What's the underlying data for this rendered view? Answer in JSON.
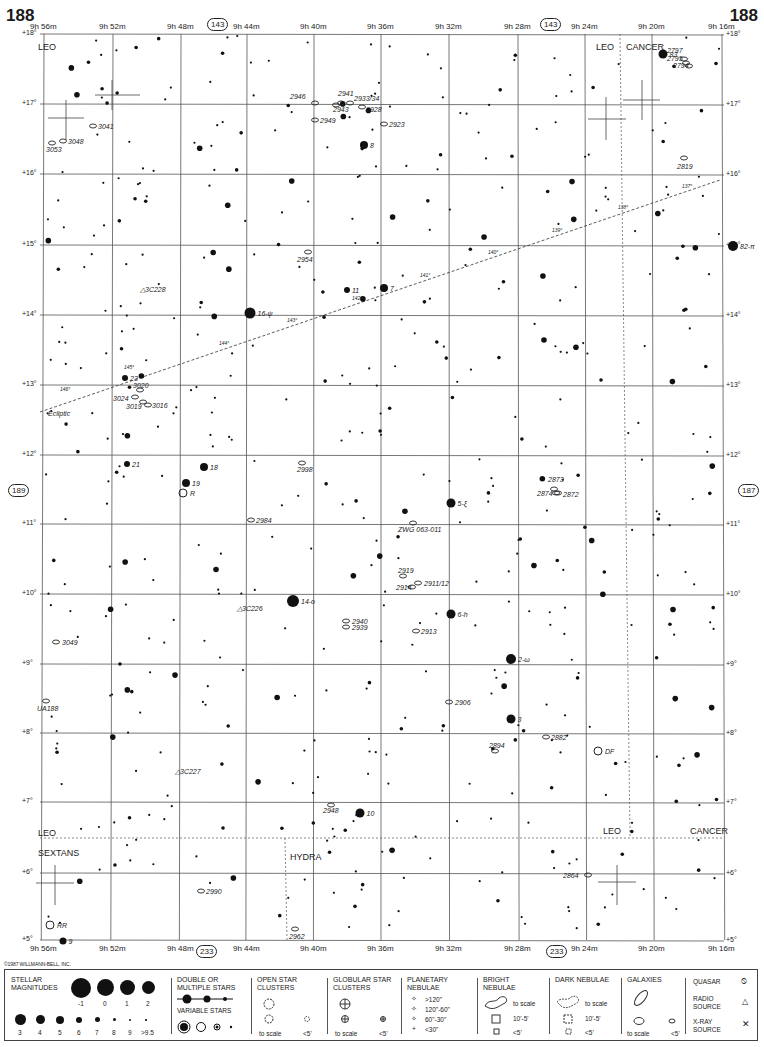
{
  "page": {
    "number_left": "188",
    "number_right": "188",
    "adjacent_left": "189",
    "adjacent_right": "187",
    "adjacent_top": "143",
    "adjacent_bottom": "233",
    "copyright": "©1987 WILLMANN-BELL, INC."
  },
  "axes": {
    "ra_top": [
      "9h 56m",
      "9h 52m",
      "9h 48m",
      "9h 44m",
      "9h 40m",
      "9h 36m",
      "9h 32m",
      "9h 28m",
      "9h 24m",
      "9h 20m",
      "9h 16m"
    ],
    "ra_bottom": [
      "9h 56m",
      "9h 52m",
      "9h 48m",
      "9h 44m",
      "9h 40m",
      "9h 36m",
      "9h 32m",
      "9h 28m",
      "9h 24m",
      "9h 20m",
      "9h 16m"
    ],
    "dec": [
      "+18°",
      "+17°",
      "+16°",
      "+15°",
      "+14°",
      "+13°",
      "+12°",
      "+11°",
      "+10°",
      "+9°",
      "+8°",
      "+7°",
      "+6°",
      "+5°"
    ]
  },
  "constellations": [
    {
      "name": "LEO",
      "x": 38,
      "y": 42
    },
    {
      "name": "LEO",
      "x": 596,
      "y": 42
    },
    {
      "name": "CANCER",
      "x": 626,
      "y": 42
    },
    {
      "name": "LEO",
      "x": 38,
      "y": 828
    },
    {
      "name": "SEXTANS",
      "x": 38,
      "y": 848
    },
    {
      "name": "HYDRA",
      "x": 290,
      "y": 852
    },
    {
      "name": "LEO",
      "x": 603,
      "y": 826
    },
    {
      "name": "CANCER",
      "x": 690,
      "y": 826
    }
  ],
  "ecliptic": {
    "label": "Ecliptic",
    "ticks": [
      "146°",
      "145°",
      "144°",
      "143°",
      "142°",
      "141°",
      "140°",
      "139°",
      "138°",
      "137°"
    ]
  },
  "labeled_stars": [
    {
      "label": "83",
      "x": 663,
      "y": 54,
      "r": 4.5
    },
    {
      "label": "8",
      "x": 364,
      "y": 145,
      "r": 4
    },
    {
      "label": "82-π",
      "x": 733,
      "y": 246,
      "r": 5
    },
    {
      "label": "16-ψ",
      "x": 250,
      "y": 313,
      "r": 5.5
    },
    {
      "label": "11",
      "x": 347,
      "y": 290,
      "r": 3
    },
    {
      "label": "7",
      "x": 384,
      "y": 288,
      "r": 4
    },
    {
      "label": "23",
      "x": 125,
      "y": 378,
      "r": 3
    },
    {
      "label": "21",
      "x": 127,
      "y": 464,
      "r": 3
    },
    {
      "label": "18",
      "x": 204,
      "y": 467,
      "r": 4
    },
    {
      "label": "19",
      "x": 186,
      "y": 483,
      "r": 4
    },
    {
      "label": "5-ξ",
      "x": 451,
      "y": 503,
      "r": 4.5
    },
    {
      "label": "14-o",
      "x": 293,
      "y": 601,
      "r": 6
    },
    {
      "label": "6-h",
      "x": 451,
      "y": 614,
      "r": 4.5
    },
    {
      "label": "2-ω",
      "x": 511,
      "y": 659,
      "r": 5
    },
    {
      "label": "3",
      "x": 511,
      "y": 719,
      "r": 4.5
    },
    {
      "label": "10",
      "x": 360,
      "y": 813,
      "r": 4.5
    },
    {
      "label": "9",
      "x": 63,
      "y": 941,
      "r": 3.5
    }
  ],
  "variable_stars": [
    {
      "label": "R",
      "x": 183,
      "y": 493
    },
    {
      "label": "DF",
      "x": 598,
      "y": 751
    },
    {
      "label": "RR",
      "x": 50,
      "y": 925
    }
  ],
  "galaxies": [
    "3041",
    "3048",
    "3053",
    "2946",
    "2941",
    "2943",
    "2933/34",
    "2928",
    "2949",
    "2923",
    "2797",
    "2795",
    "2794",
    "2819",
    "2954",
    "3020",
    "3024",
    "3019",
    "3016",
    "2998",
    "2984",
    "2873",
    "2874",
    "2872",
    "ZWG 063-011",
    "2919",
    "2914",
    "2911/12",
    "2940",
    "2939",
    "2913",
    "3049",
    "UA188",
    "2906",
    "2882",
    "2894",
    "2948",
    "2990",
    "2962",
    "2864"
  ],
  "radio_sources": [
    {
      "label": "3C228",
      "x": 140,
      "y": 289
    },
    {
      "label": "3C226",
      "x": 237,
      "y": 608
    },
    {
      "label": "3C227",
      "x": 175,
      "y": 771
    }
  ],
  "legend": {
    "stellar_magnitudes": {
      "title": "STELLAR MAGNITUDES",
      "row1": [
        "-1",
        "0",
        "1",
        "2"
      ],
      "row2": [
        "3",
        "4",
        "5",
        "6",
        "7",
        "8",
        "9",
        ">9.5"
      ]
    },
    "double_stars": {
      "title": "DOUBLE OR MULTIPLE STARS"
    },
    "variable_stars": {
      "title": "VARIABLE STARS"
    },
    "open_clusters": {
      "title": "OPEN STAR CLUSTERS",
      "to_scale": "to scale",
      "small": "<5'"
    },
    "globular_clusters": {
      "title": "GLOBULAR STAR CLUSTERS",
      "to_scale": "to scale",
      "small": "<5'"
    },
    "planetary_nebulae": {
      "title": "PLANETARY NEBULAE",
      "sizes": [
        ">120\"",
        "120\"-60\"",
        "60\"-30\"",
        "<30\""
      ]
    },
    "bright_nebulae": {
      "title": "BRIGHT NEBULAE",
      "sizes": [
        "to scale",
        "10'-5'",
        "<5'"
      ]
    },
    "dark_nebulae": {
      "title": "DARK NEBULAE",
      "sizes": [
        "to scale",
        "10'-5'",
        "<5'"
      ]
    },
    "galaxies": {
      "title": "GALAXIES",
      "to_scale": "to scale",
      "small": "<5'"
    },
    "quasar": {
      "title": "QUASAR"
    },
    "radio_source": {
      "title": "RADIO SOURCE"
    },
    "xray_source": {
      "title": "X-RAY SOURCE"
    }
  }
}
